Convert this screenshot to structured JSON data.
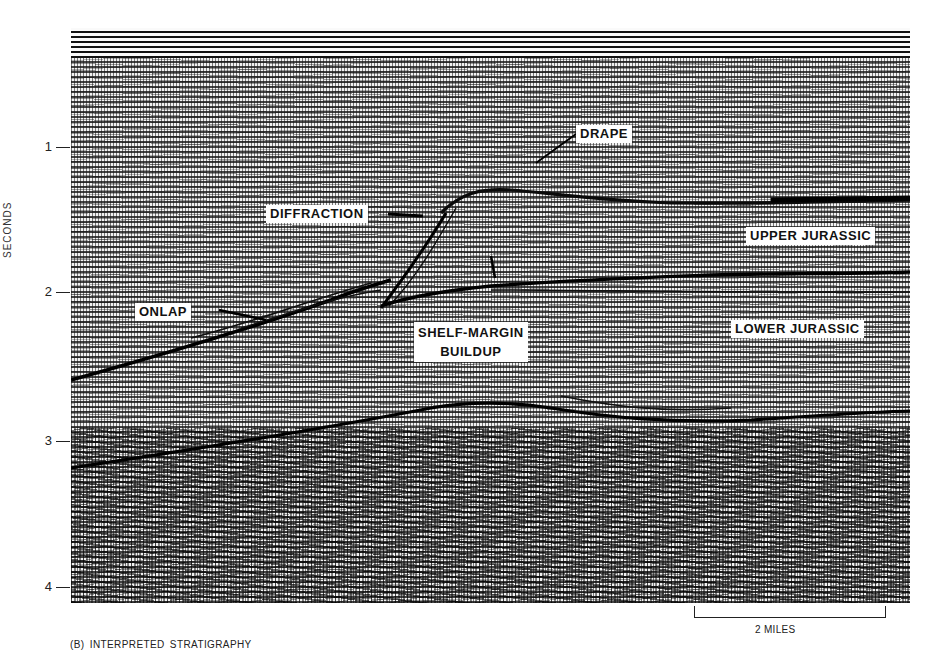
{
  "figure": {
    "caption": "(B)   INTERPRETED STRATIGRAPHY",
    "y_axis": {
      "title": "SECONDS",
      "ticks": [
        {
          "label": "1",
          "y": 147
        },
        {
          "label": "2",
          "y": 292
        },
        {
          "label": "3",
          "y": 441
        },
        {
          "label": "4",
          "y": 587
        }
      ]
    },
    "scale_bar": {
      "label": "2 MILES"
    },
    "annotations": {
      "drape": "DRAPE",
      "diffraction": "DIFFRACTION",
      "upper_jurassic": "UPPER JURASSIC",
      "onlap": "ONLAP",
      "shelf_margin_line1": "SHELF-MARGIN",
      "shelf_margin_line2": "BUILDUP",
      "lower_jurassic": "LOWER JURASSIC"
    },
    "colors": {
      "background": "#ffffff",
      "ink": "#111111",
      "label_fill": "#ffffff"
    }
  }
}
